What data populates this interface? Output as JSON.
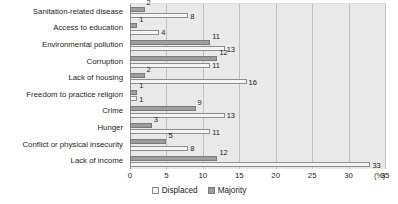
{
  "chart_data": {
    "type": "bar",
    "orientation": "horizontal",
    "title": "",
    "xlabel": "35 (%)",
    "ylabel": "",
    "xlim": [
      0,
      35
    ],
    "xticks": [
      "0",
      "5",
      "10",
      "15",
      "20",
      "25",
      "30",
      "35"
    ],
    "x_unit": "(%)",
    "grid": true,
    "legend_position": "bottom-right",
    "categories": [
      "Sanitation-related disease",
      "Access to education",
      "Environmental pollution",
      "Corruption",
      "Lack of housing",
      "Freedom to practice religion",
      "Crime",
      "Hunger",
      "Conflict or physical insecurity",
      "Lack of income"
    ],
    "series": [
      {
        "name": "Majority",
        "color": "#9d9d9d",
        "values": [
          2,
          1,
          11,
          12,
          2,
          1,
          9,
          3,
          5,
          12
        ]
      },
      {
        "name": "Displaced",
        "color": "#f4f4f4",
        "values": [
          8,
          4,
          13,
          11,
          16,
          1,
          13,
          11,
          8,
          33
        ]
      }
    ]
  },
  "legend": {
    "items": [
      {
        "label": "Displaced",
        "swatch": "displaced"
      },
      {
        "label": "Majority",
        "swatch": "majority"
      }
    ]
  }
}
